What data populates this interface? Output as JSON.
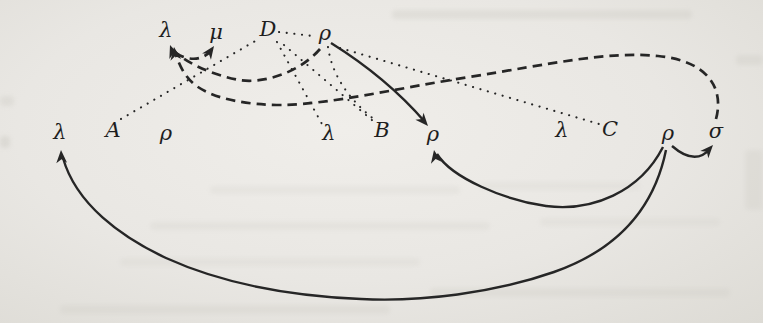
{
  "figure": {
    "description_label": "list-structure-diagram",
    "ink_color": "#262626",
    "paper_color": "#e9e7e3",
    "nodes": [
      {
        "id": "lambda-top",
        "label": "λ",
        "x": 166,
        "y": 30
      },
      {
        "id": "mu-top",
        "label": "μ",
        "x": 216,
        "y": 32
      },
      {
        "id": "d-top",
        "label": "D",
        "x": 268,
        "y": 29
      },
      {
        "id": "rho-top",
        "label": "ρ",
        "x": 325,
        "y": 33
      },
      {
        "id": "lambda-1",
        "label": "λ",
        "x": 60,
        "y": 132
      },
      {
        "id": "a-mid",
        "label": "A",
        "x": 113,
        "y": 130
      },
      {
        "id": "rho-1",
        "label": "ρ",
        "x": 166,
        "y": 133
      },
      {
        "id": "lambda-2",
        "label": "λ",
        "x": 329,
        "y": 133
      },
      {
        "id": "b-mid",
        "label": "B",
        "x": 382,
        "y": 130
      },
      {
        "id": "rho-2",
        "label": "ρ",
        "x": 433,
        "y": 134
      },
      {
        "id": "lambda-3",
        "label": "λ",
        "x": 562,
        "y": 130
      },
      {
        "id": "c-mid",
        "label": "C",
        "x": 610,
        "y": 129
      },
      {
        "id": "rho-3",
        "label": "ρ",
        "x": 668,
        "y": 133
      },
      {
        "id": "sigma-mid",
        "label": "σ",
        "x": 716,
        "y": 131
      }
    ],
    "edges": [
      {
        "from": "rho-top",
        "to": "rho-2",
        "style": "solid",
        "path": "M 331 43 Q 387 78 425 122",
        "arrow": {
          "x": 428,
          "y": 126,
          "angle": 49
        }
      },
      {
        "from": "rho-3",
        "to": "rho-2",
        "style": "solid",
        "path": "M 663 147 C 640 192 592 212 546 206 C 504 200 452 178 437 154",
        "arrow": {
          "x": 434,
          "y": 150,
          "angle": -100
        }
      },
      {
        "from": "rho-3",
        "to": "lambda-1",
        "style": "solid",
        "path": "M 666 150 C 653 214 611 252 554 272 C 494 293 421 302 361 299 C 291 296 221 283 166 258 C 121 237 76 204 63 158",
        "arrow": {
          "x": 61,
          "y": 150,
          "angle": -93
        }
      },
      {
        "from": "rho-3",
        "to": "sigma-mid",
        "style": "solid",
        "path": "M 672 146 Q 695 166 710 149",
        "arrow": {
          "x": 713,
          "y": 145,
          "angle": -48
        }
      },
      {
        "from": "lambda-top",
        "to": "mu-top",
        "style": "dashed",
        "path": "M 175 53 Q 196 65 210 52",
        "arrow": {
          "x": 214,
          "y": 46,
          "angle": -55
        }
      },
      {
        "from": "rho-top",
        "to": "lambda-top",
        "style": "dashed",
        "path": "M 320 49 C 299 73 263 84 239 80 C 213 75 188 64 174 51",
        "arrow": {
          "x": 170,
          "y": 45,
          "angle": -110
        }
      },
      {
        "from": "sigma-mid",
        "to": "lambda-top",
        "style": "dashed",
        "path": "M 716 119 C 724 90 710 61 658 56 C 607 51 551 64 469 77 C 399 88 331 104 283 105 C 246 105 216 99 198 87 C 186 79 180 67 176 55",
        "arrow": {
          "x": 174,
          "y": 47,
          "angle": -98
        }
      },
      {
        "from": "a-mid",
        "to": "d-top",
        "style": "dotted",
        "path": "M 121 119 L 257 40",
        "arrow": null
      },
      {
        "from": "d-top",
        "to": "rho-top",
        "style": "dotted",
        "path": "M 279 32 L 313 36",
        "arrow": null
      },
      {
        "from": "rho-top",
        "to": "c-mid",
        "style": "dotted",
        "path": "M 340 48 L 599 124",
        "arrow": null
      },
      {
        "from": "d-top",
        "to": "lambda-2",
        "style": "dotted",
        "path": "M 277 42 L 322 124",
        "arrow": null
      },
      {
        "from": "d-top",
        "to": "b-mid",
        "style": "dotted",
        "path": "M 284 45 L 373 121",
        "arrow": null
      },
      {
        "from": "rho-top",
        "to": "b-mid",
        "style": "dotted",
        "path": "M 328 47 Q 334 88 375 120",
        "arrow": null
      }
    ]
  }
}
